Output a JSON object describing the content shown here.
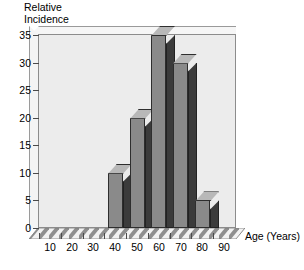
{
  "chart_data": {
    "type": "bar",
    "title": "",
    "ylabel": "Relative Incidence",
    "ylabel_lines": [
      "Relative",
      "Incidence"
    ],
    "xlabel": "Age (Years)",
    "categories": [
      "10",
      "20",
      "30",
      "40",
      "50",
      "60",
      "70",
      "80",
      "90"
    ],
    "values": [
      0,
      0,
      0,
      10,
      20,
      35,
      30,
      5,
      0
    ],
    "yticks": [
      "0",
      "5",
      "10",
      "15",
      "20",
      "25",
      "30",
      "35"
    ],
    "ytick_values": [
      0,
      5,
      10,
      15,
      20,
      25,
      30,
      35
    ],
    "ylim": [
      0,
      35
    ],
    "grid": false,
    "legend": null,
    "style": "3d-bar",
    "colors": {
      "bar_front": "#8a8a8a",
      "bar_side": "#3b3b3b",
      "bar_top": "#b8b8b8",
      "plot_background": "#ececec",
      "axis": "#8c8c8c",
      "text": "#000000"
    }
  }
}
